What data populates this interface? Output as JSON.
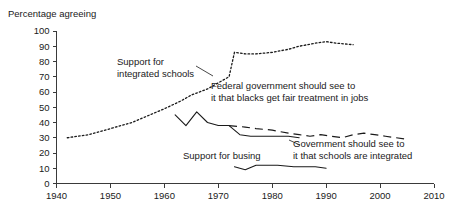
{
  "chart_data": {
    "type": "line",
    "title": "Percentage agreeing",
    "xlabel": "",
    "ylabel": "",
    "xlim": [
      1940,
      2010
    ],
    "ylim": [
      0,
      100
    ],
    "grid": false,
    "legend_position": "inline-annotations",
    "x_ticks": [
      "1940",
      "1950",
      "1960",
      "1970",
      "1980",
      "1990",
      "2000",
      "2010"
    ],
    "y_ticks": [
      "0",
      "10",
      "20",
      "30",
      "40",
      "50",
      "60",
      "70",
      "80",
      "90",
      "100"
    ],
    "series": [
      {
        "name": "Support for integrated schools",
        "style": "dotted",
        "points": [
          [
            1942,
            30
          ],
          [
            1946,
            32
          ],
          [
            1950,
            36
          ],
          [
            1954,
            40
          ],
          [
            1956,
            43
          ],
          [
            1958,
            46
          ],
          [
            1960,
            49
          ],
          [
            1963,
            54
          ],
          [
            1965,
            58
          ],
          [
            1968,
            62
          ],
          [
            1970,
            66
          ],
          [
            1972,
            70
          ],
          [
            1973,
            86
          ],
          [
            1975,
            85
          ],
          [
            1977,
            85
          ],
          [
            1980,
            86
          ],
          [
            1983,
            88
          ],
          [
            1985,
            90
          ],
          [
            1988,
            92
          ],
          [
            1990,
            93
          ],
          [
            1992,
            92
          ],
          [
            1995,
            91
          ]
        ]
      },
      {
        "name": "Federal government should see to it that blacks get fair treatment in jobs",
        "style": "dashed",
        "points": [
          [
            1972,
            38
          ],
          [
            1975,
            37
          ],
          [
            1977,
            36
          ],
          [
            1980,
            35
          ],
          [
            1983,
            33
          ],
          [
            1985,
            32
          ],
          [
            1987,
            31
          ],
          [
            1989,
            32
          ],
          [
            1991,
            31
          ],
          [
            1993,
            30
          ],
          [
            1995,
            32
          ],
          [
            1997,
            33
          ],
          [
            1999,
            32
          ],
          [
            2001,
            31
          ],
          [
            2003,
            30
          ],
          [
            2005,
            29
          ]
        ]
      },
      {
        "name": "Government should see to it that schools are integrated",
        "style": "solid",
        "points": [
          [
            1962,
            45
          ],
          [
            1964,
            38
          ],
          [
            1966,
            47
          ],
          [
            1968,
            40
          ],
          [
            1970,
            38
          ],
          [
            1972,
            38
          ],
          [
            1974,
            32
          ],
          [
            1976,
            31
          ],
          [
            1978,
            31
          ],
          [
            1980,
            31
          ],
          [
            1983,
            31
          ],
          [
            1985,
            30
          ]
        ]
      },
      {
        "name": "Support for busing",
        "style": "solid",
        "points": [
          [
            1973,
            11
          ],
          [
            1975,
            9
          ],
          [
            1977,
            12
          ],
          [
            1979,
            12
          ],
          [
            1981,
            12
          ],
          [
            1984,
            11
          ],
          [
            1986,
            11
          ],
          [
            1988,
            11
          ],
          [
            1990,
            10
          ]
        ]
      }
    ],
    "annotations": [
      {
        "name": "support-integrated-schools",
        "lines": [
          "Support for",
          "integrated schools"
        ],
        "x": 117,
        "y": 65
      },
      {
        "name": "federal-government-jobs",
        "lines": [
          "Federal government should see to",
          "it that blacks get fair treatment in jobs"
        ],
        "x": 211,
        "y": 89
      },
      {
        "name": "government-schools-integrated",
        "lines": [
          "Government should see to",
          "it that schools are integrated"
        ],
        "x": 293,
        "y": 147
      },
      {
        "name": "support-for-busing",
        "lines": [
          "Support for busing"
        ],
        "x": 183,
        "y": 159
      }
    ]
  }
}
